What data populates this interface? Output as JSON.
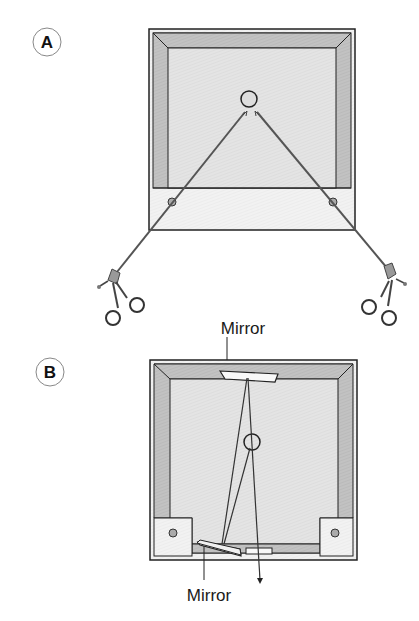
{
  "figure": {
    "panels": [
      {
        "id": "A",
        "label": "A",
        "description": "Box trainer viewed from above with two laparoscopic graspers inserted through ports converging on a target"
      },
      {
        "id": "B",
        "label": "B",
        "description": "Box trainer with mirror arrangement reflecting the line of sight onto the target"
      }
    ],
    "annotations": {
      "mirror_top": "Mirror",
      "mirror_bottom": "Mirror"
    },
    "colors": {
      "outline": "#222222",
      "frame_shade": "#bdbdbd",
      "floor": "#e6e6e6",
      "base": "#f3f3f3",
      "instrument": "#555555",
      "mirror_fill": "#f8f8f8"
    }
  }
}
